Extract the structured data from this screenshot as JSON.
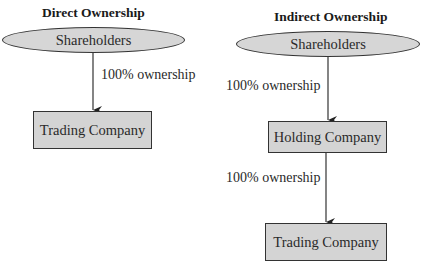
{
  "diagrams": [
    {
      "title": "Direct Ownership",
      "top": "Shareholders",
      "edges": [
        "100% ownership"
      ],
      "nodes": [
        "Trading Company"
      ]
    },
    {
      "title": "Indirect Ownership",
      "top": "Shareholders",
      "edges": [
        "100% ownership",
        "100% ownership"
      ],
      "nodes": [
        "Holding Company",
        "Trading Company"
      ]
    }
  ],
  "colors": {
    "node_fill": "#d4d4d4",
    "stroke": "#333333",
    "background": "#ffffff"
  }
}
